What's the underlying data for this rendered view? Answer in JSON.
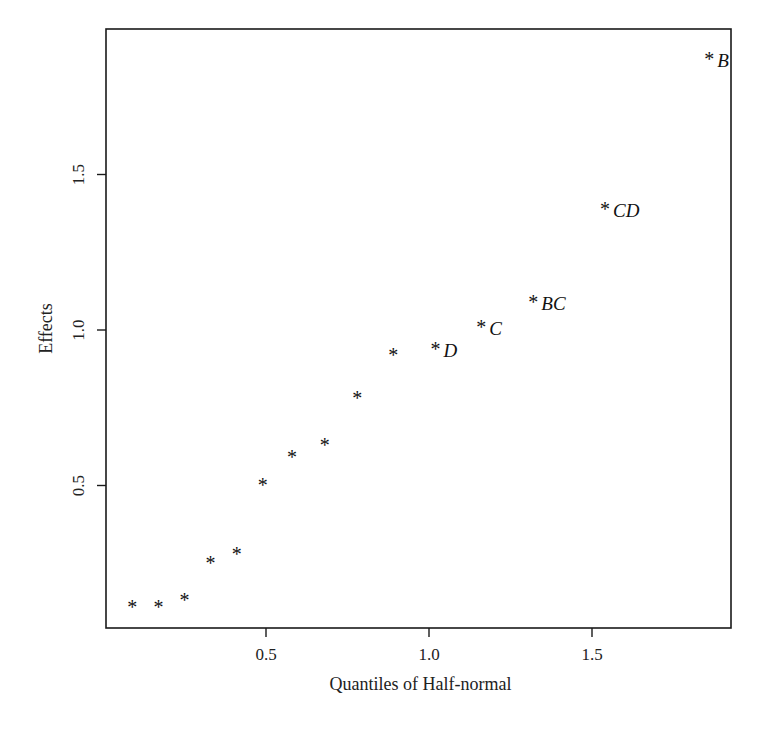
{
  "chart_data": {
    "type": "scatter",
    "title": "",
    "xlabel": "Quantiles of Half-normal",
    "ylabel": "Effects",
    "xlim": [
      0.0,
      1.92
    ],
    "ylim": [
      0.04,
      1.97
    ],
    "grid": false,
    "legend": null,
    "marker": "*",
    "x_ticks": [
      0.5,
      1.0,
      1.5
    ],
    "x_tick_labels": [
      "0.5",
      "1.0",
      "1.5"
    ],
    "y_ticks": [
      0.5,
      1.0,
      1.5
    ],
    "y_tick_labels": [
      "0.5",
      "1.0",
      "1.5"
    ],
    "points": [
      {
        "x": 0.09,
        "y": 0.12,
        "label": ""
      },
      {
        "x": 0.17,
        "y": 0.12,
        "label": ""
      },
      {
        "x": 0.25,
        "y": 0.14,
        "label": ""
      },
      {
        "x": 0.33,
        "y": 0.26,
        "label": ""
      },
      {
        "x": 0.41,
        "y": 0.29,
        "label": ""
      },
      {
        "x": 0.49,
        "y": 0.51,
        "label": ""
      },
      {
        "x": 0.58,
        "y": 0.6,
        "label": ""
      },
      {
        "x": 0.68,
        "y": 0.64,
        "label": ""
      },
      {
        "x": 0.78,
        "y": 0.79,
        "label": ""
      },
      {
        "x": 0.89,
        "y": 0.93,
        "label": ""
      },
      {
        "x": 1.02,
        "y": 0.95,
        "label": "D"
      },
      {
        "x": 1.16,
        "y": 1.02,
        "label": "C"
      },
      {
        "x": 1.32,
        "y": 1.1,
        "label": "BC"
      },
      {
        "x": 1.54,
        "y": 1.4,
        "label": "CD"
      },
      {
        "x": 1.86,
        "y": 1.88,
        "label": "B"
      }
    ]
  },
  "layout": {
    "frame": {
      "left": 106,
      "top": 29,
      "right": 731,
      "bottom": 628
    },
    "x_origin_px": 103,
    "x_px_per_unit": 326,
    "y_origin_px": 641,
    "y_px_per_unit": 311
  }
}
